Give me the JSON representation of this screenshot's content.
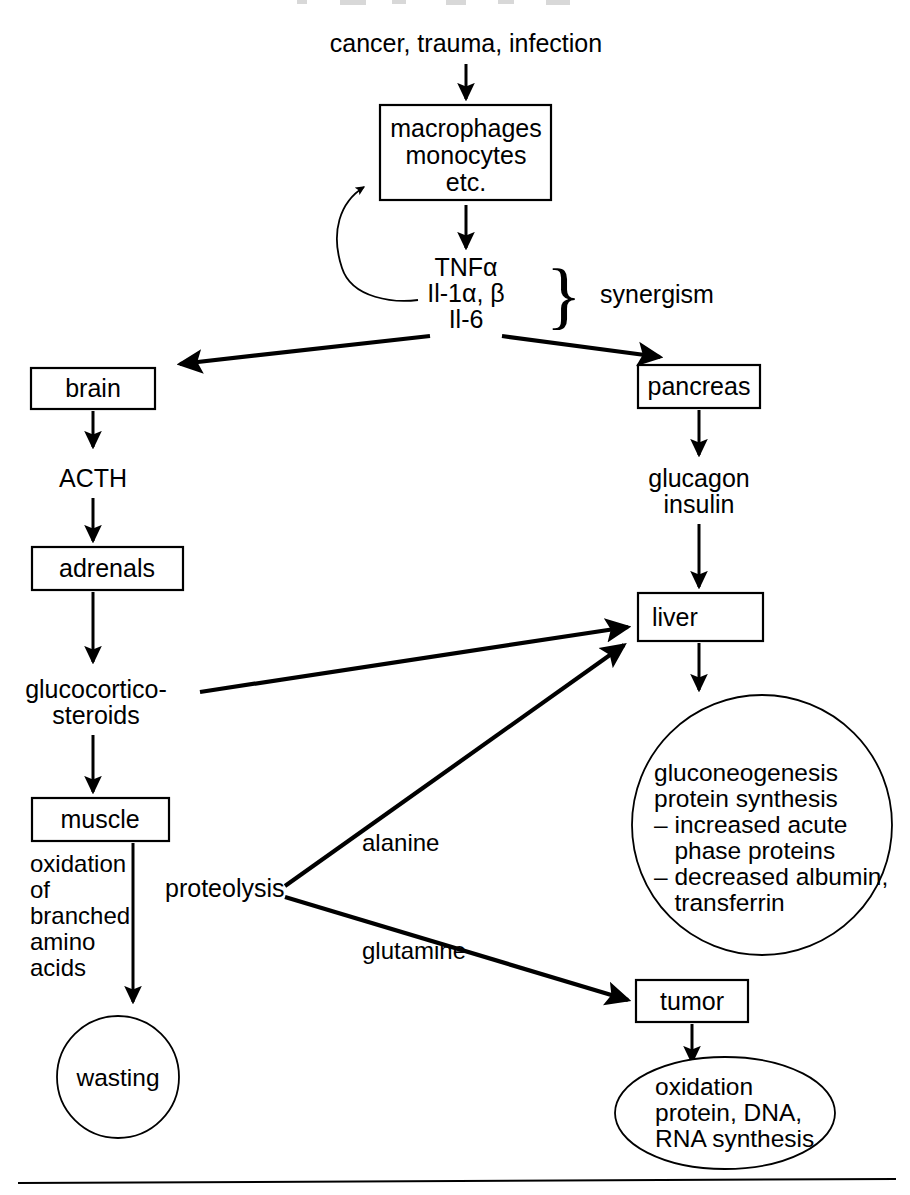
{
  "figure": {
    "background_color": "#ffffff",
    "line_color": "#000000",
    "width": 910,
    "height": 1195
  },
  "nodes": {
    "stimulus": {
      "label": "cancer, trauma, infection"
    },
    "macrophages": {
      "line1": "macrophages",
      "line2": "monocytes",
      "line3": "etc."
    },
    "cytokines": {
      "line1": "TNFα",
      "line2": "Il-1α, β",
      "line3": "Il-6"
    },
    "synergism": {
      "label": "synergism",
      "brace": "}"
    },
    "brain": {
      "label": "brain"
    },
    "acth": {
      "label": "ACTH"
    },
    "adrenals": {
      "label": "adrenals"
    },
    "glucocorticosteroids": {
      "line1": "glucocortico-",
      "line2": "steroids"
    },
    "muscle": {
      "label": "muscle"
    },
    "oxidation_bcaa": {
      "line1": "oxidation",
      "line2": "of",
      "line3": "branched",
      "line4": "amino",
      "line5": "acids"
    },
    "wasting": {
      "label": "wasting"
    },
    "proteolysis": {
      "label": "proteolysis"
    },
    "pancreas": {
      "label": "pancreas"
    },
    "hormones": {
      "line1": "glucagon",
      "line2": "insulin"
    },
    "liver": {
      "label": "liver"
    },
    "liver_functions": {
      "line1": "gluconeogenesis",
      "line2": "protein synthesis",
      "line3": "– increased acute",
      "line4": "   phase proteins",
      "line5": "– decreased albumin,",
      "line6": "   transferrin"
    },
    "tumor": {
      "label": "tumor"
    },
    "tumor_functions": {
      "line1": "oxidation",
      "line2": "protein, DNA,",
      "line3": "RNA synthesis"
    }
  },
  "edges": {
    "stimulus_to_macrophages": {
      "label": ""
    },
    "macrophages_to_cytokines": {
      "label": ""
    },
    "cytokines_feedback_to_macrophages": {
      "label": ""
    },
    "cytokines_to_brain": {
      "label": ""
    },
    "cytokines_to_pancreas": {
      "label": ""
    },
    "brain_to_acth": {
      "label": ""
    },
    "acth_to_adrenals": {
      "label": ""
    },
    "adrenals_to_glucocorticosteroids": {
      "label": ""
    },
    "glucocorticosteroids_to_muscle": {
      "label": ""
    },
    "glucocorticosteroids_to_liver": {
      "label": ""
    },
    "muscle_to_wasting": {
      "label": ""
    },
    "proteolysis_to_liver": {
      "label": "alanine"
    },
    "proteolysis_to_tumor": {
      "label": "glutamine"
    },
    "pancreas_to_hormones": {
      "label": ""
    },
    "hormones_to_liver": {
      "label": ""
    },
    "liver_to_functions": {
      "label": ""
    },
    "tumor_to_functions": {
      "label": ""
    }
  }
}
